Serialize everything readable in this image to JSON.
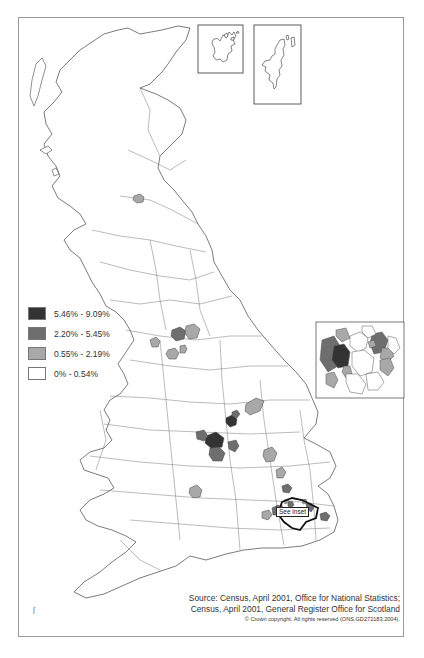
{
  "map": {
    "title": "",
    "classes": [
      {
        "label": "5.46% - 9.09%",
        "color": "#333333"
      },
      {
        "label": "2.20% - 5.45%",
        "color": "#6e6e6e"
      },
      {
        "label": "0.55% - 2.19%",
        "color": "#a8a8a8"
      },
      {
        "label": "0% - 0.54%",
        "color": "#ffffff"
      }
    ],
    "inset_label": "See inset",
    "insets": [
      "Orkney Islands",
      "Shetland Islands",
      "Greater London"
    ],
    "source": {
      "line1": "Source: Census, April 2001, Office for National Statistics;",
      "line2": "Census, April 2001, General Register Office for Scotland",
      "copyright": "© Crown copyright. All rights reserved (ONS.GD272183.2004)."
    },
    "north_mark": "ʃ",
    "shaded_areas": [
      {
        "region": "Glasgow",
        "class": 2
      },
      {
        "region": "Bradford",
        "class": 1
      },
      {
        "region": "Leeds / Kirklees",
        "class": 2
      },
      {
        "region": "Manchester",
        "class": 2
      },
      {
        "region": "Oldham",
        "class": 2
      },
      {
        "region": "Blackburn",
        "class": 2
      },
      {
        "region": "Leicester",
        "class": 0
      },
      {
        "region": "Birmingham",
        "class": 0
      },
      {
        "region": "Sandwell",
        "class": 1
      },
      {
        "region": "Wolverhampton",
        "class": 1
      },
      {
        "region": "Coventry",
        "class": 1
      },
      {
        "region": "Nottingham",
        "class": 2
      },
      {
        "region": "Derby",
        "class": 1
      },
      {
        "region": "Kettering area",
        "class": 2
      },
      {
        "region": "Bedford",
        "class": 2
      },
      {
        "region": "Luton",
        "class": 1
      },
      {
        "region": "Slough",
        "class": 1
      },
      {
        "region": "Gloucester",
        "class": 2
      },
      {
        "region": "Reading",
        "class": 2
      },
      {
        "region": "Gravesham",
        "class": 1
      },
      {
        "region": "Hillingdon",
        "class": 2
      },
      {
        "region": "Ealing / Hounslow",
        "class": 0
      },
      {
        "region": "Brent",
        "class": 1
      },
      {
        "region": "Harrow",
        "class": 2
      },
      {
        "region": "Redbridge / Newham",
        "class": 1
      },
      {
        "region": "Waltham Forest",
        "class": 2
      },
      {
        "region": "Tower Hamlets area",
        "class": 2
      }
    ]
  }
}
